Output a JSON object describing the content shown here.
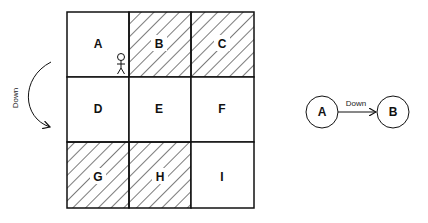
{
  "grid": {
    "cells": [
      {
        "label": "A",
        "hatched": false
      },
      {
        "label": "B",
        "hatched": true
      },
      {
        "label": "C",
        "hatched": true
      },
      {
        "label": "D",
        "hatched": false
      },
      {
        "label": "E",
        "hatched": false
      },
      {
        "label": "F",
        "hatched": false
      },
      {
        "label": "G",
        "hatched": true
      },
      {
        "label": "H",
        "hatched": true
      },
      {
        "label": "I",
        "hatched": false
      }
    ],
    "agent_cell": "A"
  },
  "action_arrow": {
    "label": "Down"
  },
  "transition": {
    "from": "A",
    "to": "B",
    "edge_label": "Down"
  },
  "colors": {
    "stroke": "#111111",
    "background": "#ffffff"
  }
}
